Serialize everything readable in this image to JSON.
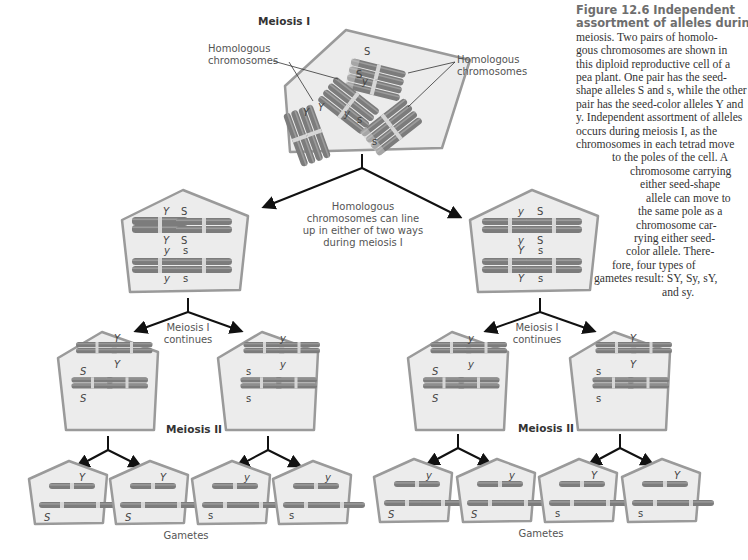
{
  "figure": {
    "caption_lines": [
      {
        "t": "Figure 12.6 Independent",
        "bold": true,
        "indent": 0
      },
      {
        "t": "assortment of alleles during",
        "bold": true,
        "indent": 0
      },
      {
        "t": "meiosis. Two pairs of homolo-",
        "bold": false,
        "indent": 0
      },
      {
        "t": "gous chromosomes are shown in",
        "bold": false,
        "indent": 0
      },
      {
        "t": "this diploid reproductive cell of a",
        "bold": false,
        "indent": 0
      },
      {
        "t": "pea plant. One pair has the seed-",
        "bold": false,
        "indent": 0
      },
      {
        "t": "shape alleles S and s, while the other",
        "bold": false,
        "indent": 0
      },
      {
        "t": "pair has the seed-color alleles Y and",
        "bold": false,
        "indent": 0
      },
      {
        "t": "y. Independent assortment of alleles",
        "bold": false,
        "indent": 0
      },
      {
        "t": "occurs during meiosis I, as the",
        "bold": false,
        "indent": 0
      },
      {
        "t": "chromosomes in each tetrad move",
        "bold": false,
        "indent": 0
      },
      {
        "t": "to the poles of the cell. A",
        "bold": false,
        "indent": 36
      },
      {
        "t": "chromosome carrying",
        "bold": false,
        "indent": 54
      },
      {
        "t": "either seed-shape",
        "bold": false,
        "indent": 64
      },
      {
        "t": "allele can move to",
        "bold": false,
        "indent": 70
      },
      {
        "t": "the same pole as a",
        "bold": false,
        "indent": 62
      },
      {
        "t": "chromosome car-",
        "bold": false,
        "indent": 60
      },
      {
        "t": "rying either seed-",
        "bold": false,
        "indent": 58
      },
      {
        "t": "color allele. There-",
        "bold": false,
        "indent": 50
      },
      {
        "t": "fore, four types of",
        "bold": false,
        "indent": 36
      },
      {
        "t": "gametes result: SY, Sy, sY,",
        "bold": false,
        "indent": 18
      },
      {
        "t": "and sy.",
        "bold": false,
        "indent": 86
      }
    ]
  },
  "labels": {
    "meiosis_1": "Meiosis I",
    "homologous_left_1": "Homologous",
    "homologous_left_2": "chromosomes",
    "homologous_right_1": "Homologous",
    "homologous_right_2": "chromosomes",
    "lineup_1": "Homologous",
    "lineup_2": "chromosomes can line",
    "lineup_3": "up in either of two ways",
    "lineup_4": "during meiosis I",
    "continues_left_1": "Meiosis I",
    "continues_left_2": "continues",
    "continues_right_1": "Meiosis I",
    "continues_right_2": "continues",
    "meiosis_2_left": "Meiosis II",
    "meiosis_2_right": "Meiosis II",
    "gametes_left": "Gametes",
    "gametes_right": "Gametes"
  },
  "alleles": {
    "top": {
      "S1": "S",
      "S2": "S",
      "y1": "y",
      "Y1": "Y",
      "Y2": "Y",
      "y2": "y",
      "s1": "s",
      "s2": "s"
    },
    "meta_left": {
      "t1": "Y",
      "t2": "S",
      "t3": "Y",
      "t4": "S",
      "b1": "y",
      "b2": "s",
      "b3": "y",
      "b4": "s"
    },
    "meta_right": {
      "t1": "y",
      "t2": "S",
      "t3": "y",
      "t4": "S",
      "b1": "Y",
      "b2": "s",
      "b3": "Y",
      "b4": "s"
    },
    "m2_cells": [
      {
        "top": "Y",
        "mid": "Y",
        "s1": "S",
        "s2": "S"
      },
      {
        "top": "y",
        "mid": "y",
        "s1": "s",
        "s2": "s"
      },
      {
        "top": "y",
        "mid": "y",
        "s1": "S",
        "s2": "S"
      },
      {
        "top": "Y",
        "mid": "Y",
        "s1": "s",
        "s2": "s"
      }
    ],
    "gametes": [
      {
        "color": "Y",
        "shape": "S"
      },
      {
        "color": "Y",
        "shape": "S"
      },
      {
        "color": "y",
        "shape": "s"
      },
      {
        "color": "y",
        "shape": "s"
      },
      {
        "color": "y",
        "shape": "S"
      },
      {
        "color": "y",
        "shape": "S"
      },
      {
        "color": "Y",
        "shape": "s"
      },
      {
        "color": "Y",
        "shape": "s"
      }
    ]
  },
  "colors": {
    "cell_fill": "#ececec",
    "cell_stroke": "#9a9a9a",
    "chromosome": "#7c7c7c",
    "band": "#cfcfcf",
    "arrow": "#111111"
  }
}
